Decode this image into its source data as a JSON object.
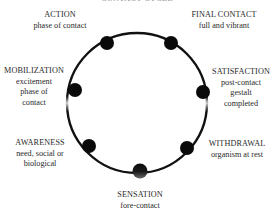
{
  "diagram": {
    "cropped_title": "CONTACT CYCLE",
    "circle": {
      "cx": 137,
      "cy": 103,
      "r": 70,
      "stroke": "#111111"
    },
    "stages": [
      {
        "id": "action",
        "title": "ACTION",
        "sub": [
          "phase of contact"
        ],
        "dot": {
          "x": 107,
          "y": 43
        }
      },
      {
        "id": "final-contact",
        "title": "FINAL CONTACT",
        "sub": [
          "full and vibrant"
        ],
        "dot": {
          "x": 171,
          "y": 43
        }
      },
      {
        "id": "mobilization",
        "title": "MOBILIZATION",
        "sub": [
          "excitement",
          "phase of",
          "contact"
        ],
        "dot": {
          "x": 75,
          "y": 90
        }
      },
      {
        "id": "satisfaction",
        "title": "SATISFACTION",
        "sub": [
          "post-contact",
          "gestalt",
          "completed"
        ],
        "dot": {
          "x": 203,
          "y": 92
        }
      },
      {
        "id": "awareness",
        "title": "AWARENESS",
        "sub": [
          "need, social or",
          "biological"
        ],
        "dot": {
          "x": 89,
          "y": 146
        }
      },
      {
        "id": "withdrawal",
        "title": "WITHDRAWAL",
        "sub": [
          "organism at rest"
        ],
        "dot": {
          "x": 187,
          "y": 148
        }
      },
      {
        "id": "sensation",
        "title": "SENSATION",
        "sub": [
          "fore-contact"
        ],
        "dot": {
          "x": 140,
          "y": 171
        }
      }
    ]
  }
}
